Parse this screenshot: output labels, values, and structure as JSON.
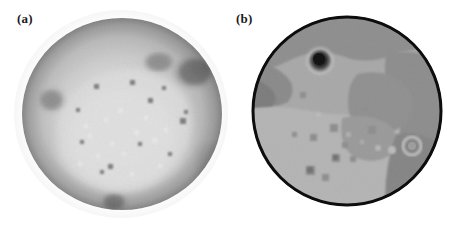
{
  "figure": {
    "background_color": "#ffffff",
    "width": 463,
    "height": 229,
    "panel_count": 2
  },
  "panels": [
    {
      "id": "a",
      "label": "(a)",
      "caption_text": "(a)",
      "image_kind": "grayscale-planetary-disk",
      "description": "Continuous-tone grayscale hemispherical disk with soft antialiased limb, bright interior highland region and darker mare patches",
      "edge_style": "soft",
      "outline_color": "none",
      "colors": {
        "background": "#ffffff",
        "limb_dark": "#8e8e8e",
        "outer_ring": "#a6a6a6",
        "mid_tone": "#c2c2c2",
        "bright_interior": "#d9d9d9",
        "brightest": "#e4e4e4",
        "dark_patch": "#8a8a8a",
        "darkest_crater": "#6e6e6e",
        "halo": "#f2f2f2"
      },
      "features": [
        {
          "name": "northeast-dark-mare",
          "cx": 172,
          "cy": 58,
          "rx": 22,
          "ry": 17,
          "tone": "#757575"
        },
        {
          "name": "north-central-dark-patch",
          "cx": 141,
          "cy": 50,
          "rx": 16,
          "ry": 11,
          "tone": "#8d8d8d"
        },
        {
          "name": "west-limb-dark-patch",
          "cx": 36,
          "cy": 88,
          "rx": 14,
          "ry": 13,
          "tone": "#8c8c8c"
        },
        {
          "name": "south-dark-patch",
          "cx": 96,
          "cy": 186,
          "rx": 13,
          "ry": 9,
          "tone": "#828282"
        },
        {
          "name": "bright-highland-core",
          "cx": 104,
          "cy": 112,
          "rx": 62,
          "ry": 55,
          "tone": "#dcdcdc"
        }
      ],
      "speckles": 26
    },
    {
      "id": "b",
      "label": "(b)",
      "caption_text": "(b)",
      "image_kind": "segmented-posterized-disk",
      "description": "Quantized / segmented version of the same disk with hard black circular outline, flat gray regions and a prominent dark circular crater in the upper-left quadrant",
      "edge_style": "hard-outline",
      "outline_color": "#0d0d0d",
      "colors": {
        "background": "#ffffff",
        "outline": "#0d0d0d",
        "light_region": "#b2b2b2",
        "mid_region": "#9b9b9b",
        "dark_region": "#878787",
        "darker_region": "#7a7a7a",
        "crater_dark": "#2b2b2b",
        "crater_core": "#151515",
        "crater_rim_bright": "#c4c4c4"
      },
      "features": [
        {
          "name": "upper-left-dark-crater",
          "cx": 74,
          "cy": 48,
          "r": 11,
          "tone": "#1c1c1c"
        },
        {
          "name": "upper-dark-band",
          "tone": "#8c8c8c"
        },
        {
          "name": "right-dark-region",
          "tone": "#858585"
        },
        {
          "name": "lower-left-light-region",
          "tone": "#b4b4b4"
        },
        {
          "name": "small-square-blobs",
          "count": 11,
          "tone": "#8d8d8d"
        }
      ],
      "speckles": 14
    }
  ]
}
